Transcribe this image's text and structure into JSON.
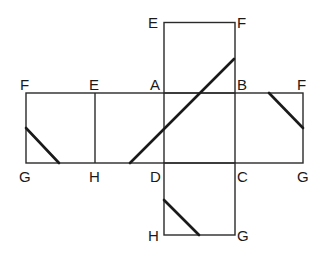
{
  "diagram": {
    "type": "cube-net",
    "stroke_color": "#2a2a2a",
    "background": "#ffffff",
    "labels": {
      "top_left": "E",
      "top_right": "F",
      "row_top_1": "F",
      "row_top_2": "E",
      "row_top_3": "A",
      "row_top_4": "B",
      "row_top_5": "F",
      "row_bottom_1": "G",
      "row_bottom_2": "H",
      "row_bottom_3": "D",
      "row_bottom_4": "C",
      "row_bottom_5": "G",
      "bottom_left": "H",
      "bottom_right": "G"
    },
    "faces": [
      {
        "name": "EFBA",
        "vertices": [
          "E",
          "F",
          "B",
          "A"
        ]
      },
      {
        "name": "FEHG",
        "vertices": [
          "F",
          "E",
          "H",
          "G"
        ]
      },
      {
        "name": "EADH",
        "vertices": [
          "E",
          "A",
          "D",
          "H"
        ]
      },
      {
        "name": "ABCD",
        "vertices": [
          "A",
          "B",
          "C",
          "D"
        ]
      },
      {
        "name": "BFGC",
        "vertices": [
          "B",
          "F",
          "G",
          "C"
        ]
      },
      {
        "name": "DCGH",
        "vertices": [
          "D",
          "C",
          "G",
          "H"
        ]
      }
    ],
    "cut_segments": [
      {
        "from": [
          130,
          163
        ],
        "to": [
          234,
          59
        ],
        "description": "long diagonal across faces EADH, ABCD, EFBA"
      },
      {
        "from": [
          26,
          128
        ],
        "to": [
          59,
          163
        ],
        "description": "segment in face FEHG"
      },
      {
        "from": [
          269,
          93
        ],
        "to": [
          303,
          128
        ],
        "description": "segment in face BFGC"
      },
      {
        "from": [
          164,
          200
        ],
        "to": [
          199,
          235
        ],
        "description": "segment in face DCGH"
      }
    ]
  }
}
